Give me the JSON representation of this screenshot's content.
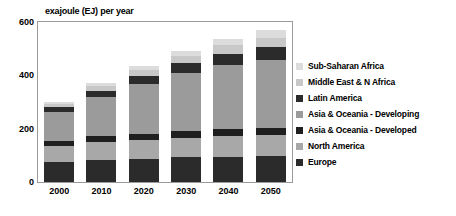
{
  "chart_data": {
    "type": "bar",
    "subtype": "stacked-vertical",
    "title": "exajoule (EJ) per year",
    "xlabel": "",
    "ylabel": "",
    "ylim": [
      0,
      600
    ],
    "yticks": [
      0,
      200,
      400,
      600
    ],
    "ytick_labels": [
      "0",
      "200",
      "400",
      "600"
    ],
    "grid": false,
    "legend_position": "right",
    "categories": [
      "2000",
      "2010",
      "2020",
      "2030",
      "2040",
      "2050"
    ],
    "series": [
      {
        "name": "Europe",
        "color": "#2b2b2b",
        "values": [
          75,
          83,
          88,
          92,
          95,
          97
        ]
      },
      {
        "name": "North America",
        "color": "#a8a8a8",
        "values": [
          60,
          66,
          70,
          74,
          77,
          79
        ]
      },
      {
        "name": "Asia & Oceania - Developed",
        "color": "#1f1f1f",
        "values": [
          20,
          22,
          23,
          24,
          25,
          25
        ]
      },
      {
        "name": "Asia & Oceania - Developing",
        "color": "#9b9b9b",
        "values": [
          108,
          148,
          188,
          218,
          242,
          258
        ]
      },
      {
        "name": "Latin America",
        "color": "#2b2b2b",
        "values": [
          17,
          24,
          30,
          37,
          43,
          48
        ]
      },
      {
        "name": "Middle East & N Africa",
        "color": "#c8c8c8",
        "values": [
          12,
          17,
          22,
          26,
          31,
          35
        ]
      },
      {
        "name": "Sub-Saharan Africa",
        "color": "#dcdcdc",
        "values": [
          8,
          12,
          16,
          20,
          25,
          30
        ]
      }
    ],
    "totals": [
      300,
      372,
      437,
      491,
      538,
      572
    ],
    "stack_order_bottom_to_top": [
      "Europe",
      "North America",
      "Asia & Oceania - Developed",
      "Asia & Oceania - Developing",
      "Latin America",
      "Middle East & N Africa",
      "Sub-Saharan Africa"
    ],
    "legend_order_top_to_bottom": [
      "Sub-Saharan Africa",
      "Middle East & N Africa",
      "Latin America",
      "Asia & Oceania - Developing",
      "Asia & Oceania - Developed",
      "North America",
      "Europe"
    ]
  },
  "colors": {
    "frame": "#9a9a9a",
    "background": "#ffffff",
    "text": "#000000"
  }
}
